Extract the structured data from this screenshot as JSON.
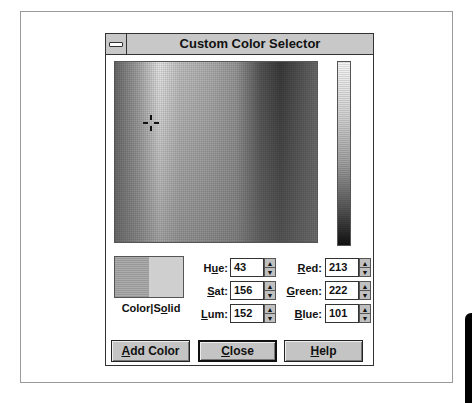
{
  "window": {
    "title": "Custom Color Selector",
    "system_menu_icon": "minus-bar-icon"
  },
  "color_picker": {
    "crosshair_icon": "crosshair-icon",
    "luminance_arrow_icon": "triangle-left-icon"
  },
  "swatch": {
    "label_prefix": "Color",
    "label_sep": "|",
    "label_s": "S",
    "label_o": "o",
    "label_rest": "lid"
  },
  "fields": {
    "hue": {
      "label_pre": "H",
      "label_ul": "u",
      "label_post": "e:",
      "value": "43"
    },
    "sat": {
      "label_pre": "",
      "label_ul": "S",
      "label_post": "at:",
      "value": "156"
    },
    "lum": {
      "label_pre": "",
      "label_ul": "L",
      "label_post": "um:",
      "value": "152"
    },
    "red": {
      "label_pre": "",
      "label_ul": "R",
      "label_post": "ed:",
      "value": "213"
    },
    "green": {
      "label_pre": "",
      "label_ul": "G",
      "label_post": "reen:",
      "value": "222"
    },
    "blue": {
      "label_pre": "",
      "label_ul": "B",
      "label_post": "lue:",
      "value": "101"
    }
  },
  "spinner": {
    "up": "▲",
    "down": "▼"
  },
  "buttons": {
    "add_color": {
      "ul": "A",
      "rest": "dd Color"
    },
    "close": {
      "ul": "C",
      "rest": "lose"
    },
    "help": {
      "ul": "H",
      "rest": "elp"
    }
  }
}
